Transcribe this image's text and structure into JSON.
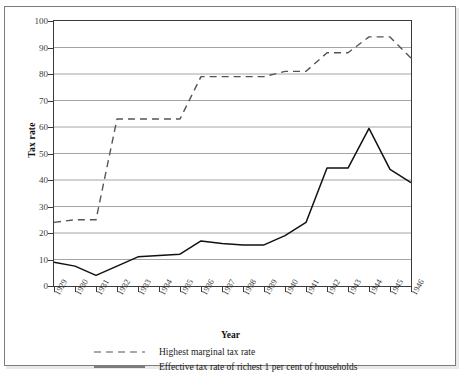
{
  "chart_data": {
    "type": "line",
    "title": "",
    "xlabel": "Year",
    "ylabel": "Tax rate",
    "grid": "horizontal",
    "legend_position": "bottom",
    "xlim": [
      1929,
      1946
    ],
    "ylim": [
      0,
      100
    ],
    "ytick_step": 10,
    "yticks": [
      0,
      10,
      20,
      30,
      40,
      50,
      60,
      70,
      80,
      90,
      100
    ],
    "categories": [
      1929,
      1930,
      1931,
      1932,
      1933,
      1934,
      1935,
      1936,
      1937,
      1938,
      1939,
      1940,
      1941,
      1942,
      1943,
      1944,
      1945,
      1946
    ],
    "xtick_labels": [
      "1929",
      "1930",
      "1931",
      "1932",
      "1933",
      "1934",
      "1935",
      "1936",
      "1937",
      "1938",
      "1939",
      "1940",
      "1941",
      "1942",
      "1943",
      "1944",
      "1945",
      "1946"
    ],
    "series": [
      {
        "name": "Highest marginal tax rate",
        "style": "dashed",
        "color": "#555555",
        "values": [
          24,
          25,
          25,
          63,
          63,
          63,
          63,
          79,
          79,
          79,
          79,
          81,
          81,
          88,
          88,
          94,
          94,
          86
        ]
      },
      {
        "name": "Effective tax rate of richest 1 per cent of households",
        "style": "solid",
        "color": "#111111",
        "values": [
          9,
          7.5,
          4,
          7.5,
          11,
          11.5,
          12,
          17,
          16,
          15.5,
          15.5,
          19,
          24,
          44.5,
          44.5,
          59.5,
          44,
          39
        ]
      }
    ]
  },
  "axes": {
    "y_title": "Tax rate",
    "x_title": "Year"
  },
  "legend": {
    "items": [
      {
        "label": "Highest marginal tax rate",
        "style": "dashed"
      },
      {
        "label": "Effective tax rate of richest 1 per cent of households",
        "style": "solid"
      }
    ]
  },
  "colors": {
    "dashed_series": "#555555",
    "solid_series": "#111111",
    "grid": "#9a9a9a",
    "axis": "#3a3a3a"
  }
}
